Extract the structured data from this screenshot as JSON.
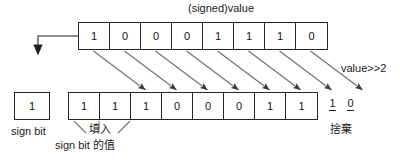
{
  "diagram": {
    "title": "(signed)value",
    "shift_label": "value>>2",
    "source_bits": [
      "1",
      "0",
      "0",
      "0",
      "1",
      "1",
      "1",
      "0"
    ],
    "result_bits": [
      "1",
      "1",
      "1",
      "0",
      "0",
      "0",
      "1",
      "1"
    ],
    "discarded_bits": [
      "1",
      "0"
    ],
    "discarded_caption": "捨棄",
    "sign_bit": {
      "value": "1",
      "caption": "sign bit"
    },
    "fill_label": "填入",
    "fill_sub_label": "sign bit 的值",
    "colors": {
      "stroke": "#262626",
      "arrow": "#555555",
      "text": "#1a1a1a",
      "background": "#ffffff"
    }
  }
}
